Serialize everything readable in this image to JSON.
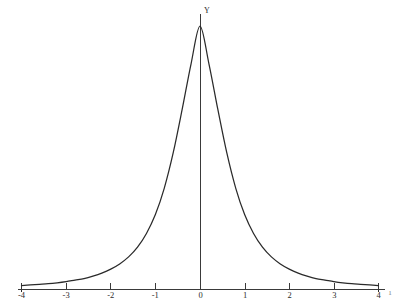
{
  "chart_data": {
    "type": "line",
    "title": "",
    "subtitle": "",
    "xlabel": "",
    "ylabel": "Y",
    "xlim": [
      -4,
      4
    ],
    "ylim": [
      0,
      1
    ],
    "grid": false,
    "legend": "none",
    "x_tick_labels": [
      "-4",
      "-3",
      "-2",
      "-1",
      "0",
      "1",
      "2",
      "3",
      "4"
    ],
    "x_ticks": [
      -4,
      -3,
      -2,
      -1,
      0,
      1,
      2,
      3,
      4
    ],
    "y_ticks": [],
    "y_tick_labels": [],
    "series": [
      {
        "name": "density",
        "x": [
          -4,
          -3.8,
          -3.6,
          -3.4,
          -3.2,
          -3,
          -2.8,
          -2.6,
          -2.4,
          -2.2,
          -2,
          -1.8,
          -1.6,
          -1.4,
          -1.2,
          -1,
          -0.8,
          -0.6,
          -0.4,
          -0.2,
          0,
          0.2,
          0.4,
          0.6,
          0.8,
          1,
          1.2,
          1.4,
          1.6,
          1.8,
          2,
          2.2,
          2.4,
          2.6,
          2.8,
          3,
          3.2,
          3.4,
          3.6,
          3.8,
          4
        ],
        "y": [
          0.013,
          0.015,
          0.017,
          0.019,
          0.022,
          0.026,
          0.031,
          0.036,
          0.044,
          0.054,
          0.067,
          0.084,
          0.107,
          0.139,
          0.184,
          0.246,
          0.333,
          0.449,
          0.591,
          0.741,
          0.865,
          0.741,
          0.591,
          0.449,
          0.333,
          0.246,
          0.184,
          0.139,
          0.107,
          0.084,
          0.067,
          0.054,
          0.044,
          0.036,
          0.031,
          0.026,
          0.022,
          0.019,
          0.017,
          0.015,
          0.013
        ]
      }
    ]
  },
  "axes": {
    "y_axis_label": "Y",
    "corner_note": "1"
  },
  "colors": {
    "curve": "#2a2a2a",
    "axis": "#3a3a3a",
    "background": "#ffffff",
    "label": "#2b2b2b"
  }
}
